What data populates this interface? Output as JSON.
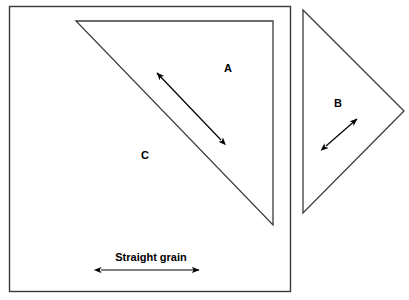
{
  "figure": {
    "background_color": "#ffffff",
    "line_color": "#3a3a3a",
    "text_color": "#000000",
    "labels": {
      "piece_a": "A",
      "piece_b": "B",
      "piece_c": "C",
      "grain": "Straight grain"
    },
    "shapes": {
      "outer_square": {
        "name": "square-block-outline",
        "x": 9,
        "y": 6,
        "width": 281,
        "height": 285
      },
      "triangle_a": {
        "name": "triangle-a",
        "points": "76,21 273,21 273,225"
      },
      "triangle_b": {
        "name": "triangle-b",
        "points": "303,10 404,111 303,213"
      }
    },
    "arrows": {
      "grain_arrow_horizontal": {
        "name": "grain-arrow-horizontal",
        "x1": 101,
        "y1": 270,
        "x2": 199,
        "y2": 270
      },
      "grain_arrow_a": {
        "name": "grain-arrow-a",
        "x1": 221,
        "y1": 140,
        "x2": 157,
        "y2": 73
      },
      "grain_arrow_b": {
        "name": "grain-arrow-b",
        "x1": 326,
        "y1": 146,
        "x2": 357,
        "y2": 119
      }
    },
    "label_positions": {
      "piece_a": {
        "x": 228,
        "y": 69
      },
      "piece_b": {
        "x": 338,
        "y": 104
      },
      "piece_c": {
        "x": 145,
        "y": 156
      },
      "grain": {
        "x": 151,
        "y": 258
      }
    }
  }
}
